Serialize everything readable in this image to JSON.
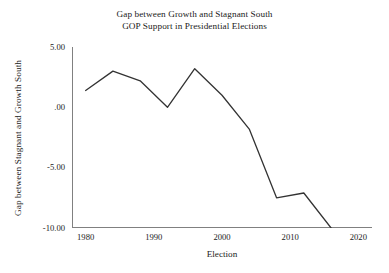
{
  "chart_data": {
    "type": "line",
    "title": "Gap between Growth and Stagnant South GOP Support in Presidential Elections",
    "title_lines": [
      "Gap between Growth and Stagnant South",
      "GOP Support in Presidential Elections"
    ],
    "xlabel": "Election",
    "ylabel": "Gap between Stagnant and Growth South",
    "x": [
      1980,
      1984,
      1988,
      1992,
      1996,
      2000,
      2004,
      2008,
      2012,
      2016
    ],
    "values": [
      1.4,
      3.0,
      2.2,
      0.0,
      3.2,
      1.0,
      -1.8,
      -7.5,
      -7.1,
      -10.0
    ],
    "series": [
      {
        "name": "Gap between Stagnant and Growth South",
        "values": [
          1.4,
          3.0,
          2.2,
          0.0,
          3.2,
          1.0,
          -1.8,
          -7.5,
          -7.1,
          -10.0
        ],
        "color": "#333333"
      }
    ],
    "xlim": [
      1978,
      2022
    ],
    "ylim": [
      -10.0,
      5.0
    ],
    "xticks": [
      1980,
      1990,
      2000,
      2010,
      2020
    ],
    "xtick_labels": [
      "1980",
      "1990",
      "2000",
      "2010",
      "2020"
    ],
    "yticks": [
      5.0,
      0.0,
      -5.0,
      -10.0
    ],
    "ytick_labels": [
      "5.00",
      ".00",
      "-5.00",
      "-10.00"
    ],
    "grid": false,
    "legend": "none",
    "line_color": "#333333",
    "axis_color": "#808080",
    "background": "#ffffff"
  }
}
